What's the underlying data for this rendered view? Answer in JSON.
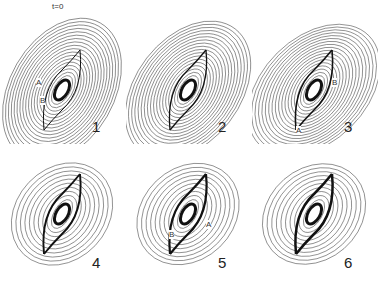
{
  "figure": {
    "panels": [
      {
        "number": "1",
        "labels": [
          "t=0",
          "A",
          "B"
        ]
      },
      {
        "number": "2",
        "labels": []
      },
      {
        "number": "3",
        "labels": [
          "A",
          "B"
        ]
      },
      {
        "number": "4",
        "labels": []
      },
      {
        "number": "5",
        "labels": [
          "A",
          "B"
        ]
      },
      {
        "number": "6",
        "labels": []
      }
    ]
  }
}
